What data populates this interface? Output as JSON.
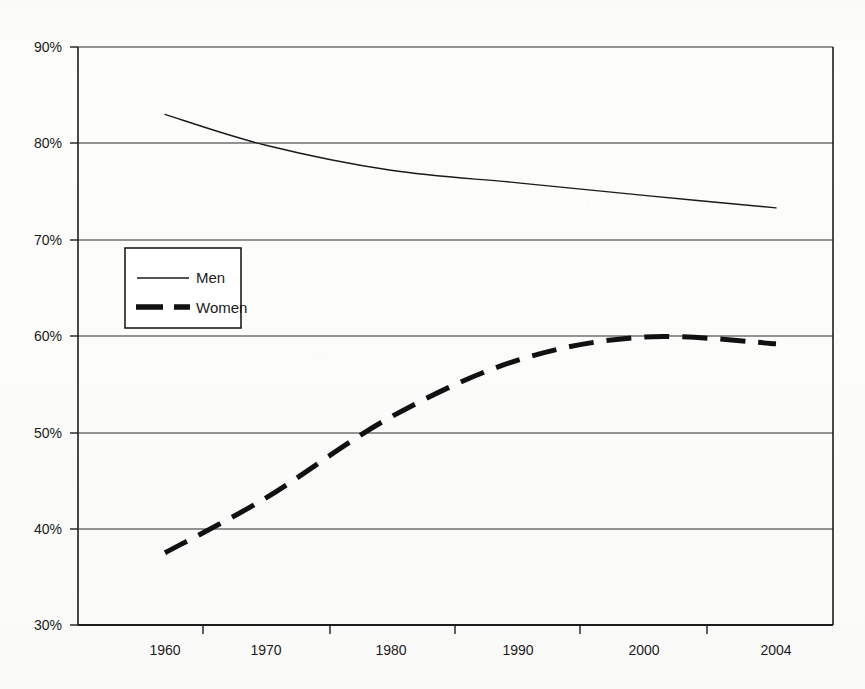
{
  "chart_data": {
    "type": "line",
    "title": "",
    "subtitle": "",
    "xlabel": "",
    "ylabel": "",
    "x": [
      1960,
      1970,
      1980,
      1990,
      2000,
      2004
    ],
    "categories": [
      "1960",
      "1970",
      "1980",
      "1990",
      "2000",
      "2004"
    ],
    "xtick_labels": [
      "1960",
      "1970",
      "1980",
      "1990",
      "2000",
      "2004"
    ],
    "ytick_labels": [
      "90%",
      "80%",
      "70%",
      "60%",
      "50%",
      "40%",
      "30%"
    ],
    "ytick_values": [
      90,
      80,
      70,
      60,
      50,
      40,
      30
    ],
    "ylim": [
      30,
      90
    ],
    "yunit": "%",
    "grid": "horizontal",
    "legend_position": "inside-left-middle",
    "series": [
      {
        "name": "Men",
        "style": "solid",
        "width": 1.4,
        "color": "#1a1a1a",
        "values": [
          83.0,
          79.8,
          77.2,
          75.9,
          74.6,
          73.3
        ]
      },
      {
        "name": "Women",
        "style": "dashed",
        "width": 5.0,
        "color": "#111111",
        "values": [
          37.5,
          43.2,
          51.6,
          57.5,
          59.9,
          59.2
        ]
      }
    ],
    "annotations": []
  },
  "legend": {
    "entries": [
      {
        "label": "Men",
        "style": "solid"
      },
      {
        "label": "Women",
        "style": "dashed"
      }
    ]
  },
  "axis": {
    "y_labels": [
      "90%",
      "80%",
      "70%",
      "60%",
      "50%",
      "40%",
      "30%"
    ],
    "x_labels": [
      "1960",
      "1970",
      "1980",
      "1990",
      "2000",
      "2004"
    ]
  }
}
